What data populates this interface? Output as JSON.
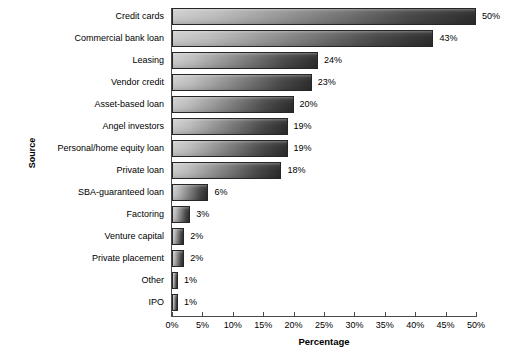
{
  "chart_data": {
    "type": "bar",
    "orientation": "horizontal",
    "title": "",
    "xlabel": "Percentage",
    "ylabel": "Source",
    "xlim": [
      0,
      50
    ],
    "xunit": "%",
    "grid": false,
    "legend": false,
    "xticks": [
      "0%",
      "5%",
      "10%",
      "15%",
      "20%",
      "25%",
      "30%",
      "35%",
      "40%",
      "45%",
      "50%"
    ],
    "xtick_values": [
      0,
      5,
      10,
      15,
      20,
      25,
      30,
      35,
      40,
      45,
      50
    ],
    "categories": [
      "Credit cards",
      "Commercial bank loan",
      "Leasing",
      "Vendor credit",
      "Asset-based loan",
      "Angel investors",
      "Personal/home equity loan",
      "Private loan",
      "SBA-guaranteed loan",
      "Factoring",
      "Venture capital",
      "Private placement",
      "Other",
      "IPO"
    ],
    "values": [
      50,
      43,
      24,
      23,
      20,
      19,
      19,
      18,
      6,
      3,
      2,
      2,
      1,
      1
    ],
    "value_labels": [
      "50%",
      "43%",
      "24%",
      "23%",
      "20%",
      "19%",
      "19%",
      "18%",
      "6%",
      "3%",
      "2%",
      "2%",
      "1%",
      "1%"
    ],
    "colors": {
      "bar_gradient_start": "#cdcdcd",
      "bar_gradient_end": "#2e2e2e",
      "bar_outline": "#262626",
      "axis": "#4a4a4a",
      "text": "#000000",
      "background": "#ffffff"
    }
  }
}
